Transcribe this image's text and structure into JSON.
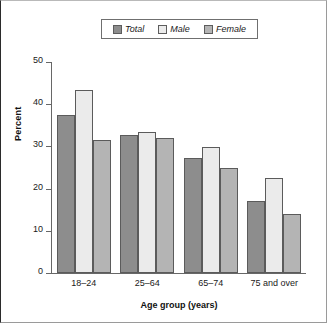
{
  "chart_data": {
    "type": "bar",
    "title": "",
    "xlabel": "Age group (years)",
    "ylabel": "Percent",
    "categories": [
      "18–24",
      "25–64",
      "65–74",
      "75 and over"
    ],
    "series": [
      {
        "name": "Total",
        "values": [
          37.4,
          32.7,
          27.2,
          17.1
        ],
        "color": "#8d8d8d"
      },
      {
        "name": "Male",
        "values": [
          43.3,
          33.4,
          29.8,
          22.5
        ],
        "color": "#ebebeb"
      },
      {
        "name": "Female",
        "values": [
          31.5,
          32.0,
          24.9,
          14.0
        ],
        "color": "#b4b4b4"
      }
    ],
    "ylim": [
      0,
      50
    ],
    "yticks": [
      0,
      10,
      20,
      30,
      40,
      50
    ],
    "ytick_labels": [
      "0",
      "10",
      "20",
      "30",
      "40",
      "50"
    ],
    "grid": false,
    "legend_position": "top-center",
    "legend_entries": [
      "Total",
      "Male",
      "Female"
    ]
  },
  "legend": {
    "items": [
      {
        "label": "Total",
        "swatch": "legend-swatch-total"
      },
      {
        "label": "Male",
        "swatch": "legend-swatch-male"
      },
      {
        "label": "Female",
        "swatch": "legend-swatch-female"
      }
    ]
  },
  "axes": {
    "y_title": "Percent",
    "x_title": "Age group (years)",
    "y_ticks": [
      "50",
      "40",
      "30",
      "20",
      "10",
      "0"
    ],
    "x_ticks": [
      "18–24",
      "25–64",
      "65–74",
      "75 and over"
    ]
  },
  "colors": {
    "total": "#8d8d8d",
    "male": "#ebebeb",
    "female": "#b4b4b4",
    "axis": "#676767",
    "bar_outline": "#5b5b5b",
    "text": "#1a1a1a",
    "frame": "#9a9a9a"
  }
}
